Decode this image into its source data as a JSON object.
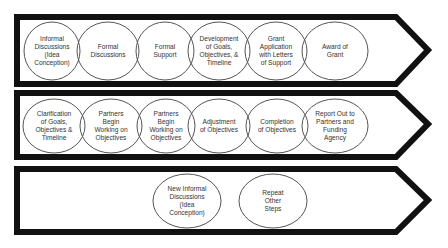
{
  "diagram": {
    "colors": {
      "arrow_stroke": "#111111",
      "ellipse_stroke": "#555555",
      "text": "#333333",
      "background": "#ffffff"
    },
    "rows": [
      {
        "steps": [
          {
            "label": "Informal\nDiscussions\n(Idea\nConception)",
            "cx": 52,
            "cy": 51,
            "rx": 28,
            "ry": 29
          },
          {
            "label": "Formal\nDiscussions",
            "cx": 108,
            "cy": 51,
            "rx": 31,
            "ry": 29
          },
          {
            "label": "Formal\nSupport",
            "cx": 165,
            "cy": 51,
            "rx": 29,
            "ry": 29
          },
          {
            "label": "Development\nof Goals,\nObjectives, &\nTimeline",
            "cx": 219,
            "cy": 51,
            "rx": 31,
            "ry": 29
          },
          {
            "label": "Grant\nApplication\nwith Letters\nof Support",
            "cx": 276,
            "cy": 51,
            "rx": 31,
            "ry": 29
          },
          {
            "label": "Award of\nGrant",
            "cx": 335,
            "cy": 51,
            "rx": 33,
            "ry": 29
          }
        ]
      },
      {
        "steps": [
          {
            "label": "Clarification\nof Goals,\nObjectives &\nTimeline",
            "cx": 54,
            "cy": 126,
            "rx": 31,
            "ry": 27
          },
          {
            "label": "Partners\nBegin\nWorking on\nObjectives",
            "cx": 111,
            "cy": 126,
            "rx": 31,
            "ry": 27
          },
          {
            "label": "Partners\nBegin\nWorking on\nObjectives",
            "cx": 166,
            "cy": 126,
            "rx": 29,
            "ry": 27
          },
          {
            "label": "Adjustment\nof Objectives",
            "cx": 219,
            "cy": 126,
            "rx": 31,
            "ry": 27
          },
          {
            "label": "Completion\nof Objectives",
            "cx": 277,
            "cy": 126,
            "rx": 31,
            "ry": 27
          },
          {
            "label": "Report Out to\nPartners and\nFunding\nAgency",
            "cx": 335,
            "cy": 126,
            "rx": 33,
            "ry": 27
          }
        ]
      },
      {
        "steps": [
          {
            "label": "New Informal\nDiscussions\n(Idea\nConception)",
            "cx": 187,
            "cy": 201,
            "rx": 34,
            "ry": 27
          },
          {
            "label": "Repeat\nOther\nSteps",
            "cx": 273,
            "cy": 201,
            "rx": 34,
            "ry": 27
          }
        ]
      }
    ],
    "arrows": [
      {
        "points": "17,17 396,17 428,50 396,84 17,84"
      },
      {
        "points": "17,93 396,93 428,124 396,157 17,157"
      },
      {
        "points": "17,169 396,169 428,200 396,232 17,232"
      }
    ]
  }
}
